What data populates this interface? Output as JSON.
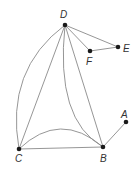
{
  "diagram": {
    "type": "graph",
    "vertices": [
      {
        "id": "D",
        "label": "D",
        "x": 65,
        "y": 25,
        "lx": 60,
        "ly": 18
      },
      {
        "id": "E",
        "label": "E",
        "x": 118,
        "y": 47,
        "lx": 123,
        "ly": 52
      },
      {
        "id": "F",
        "label": "F",
        "x": 90,
        "y": 51,
        "lx": 86,
        "ly": 65
      },
      {
        "id": "A",
        "label": "A",
        "x": 126,
        "y": 122,
        "lx": 121,
        "ly": 118
      },
      {
        "id": "B",
        "label": "B",
        "x": 103,
        "y": 147,
        "lx": 100,
        "ly": 162
      },
      {
        "id": "C",
        "label": "C",
        "x": 19,
        "y": 149,
        "lx": 15,
        "ly": 162
      }
    ],
    "edges": [
      {
        "from": "D",
        "to": "E",
        "path": "M65,25 L118,47"
      },
      {
        "from": "D",
        "to": "F",
        "path": "M65,25 L90,51"
      },
      {
        "from": "F",
        "to": "E",
        "path": "M90,51 L118,47"
      },
      {
        "from": "D",
        "to": "C",
        "path": "M65,25 Q5,70 19,149",
        "curved": true
      },
      {
        "from": "D",
        "to": "C",
        "path": "M65,25 L19,149"
      },
      {
        "from": "D",
        "to": "B",
        "path": "M65,25 Q55,120 103,147",
        "curved": true
      },
      {
        "from": "D",
        "to": "B",
        "path": "M65,25 L103,147"
      },
      {
        "from": "C",
        "to": "B",
        "path": "M19,149 Q60,110 103,147",
        "curved": true
      },
      {
        "from": "C",
        "to": "B",
        "path": "M19,149 L103,147"
      },
      {
        "from": "B",
        "to": "A",
        "path": "M103,147 L126,122"
      }
    ]
  }
}
